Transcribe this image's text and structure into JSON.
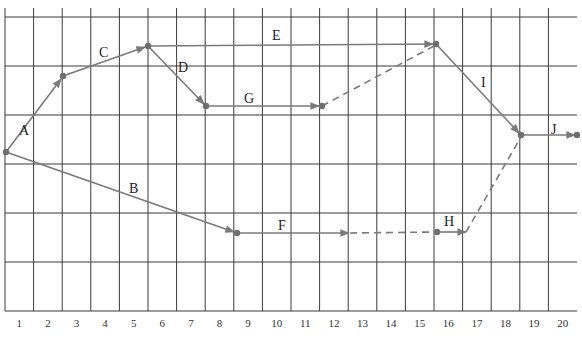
{
  "diagram": {
    "type": "activity-network-on-time-grid",
    "axis": {
      "labels": [
        "1",
        "2",
        "3",
        "4",
        "5",
        "6",
        "7",
        "8",
        "9",
        "10",
        "11",
        "12",
        "13",
        "14",
        "15",
        "16",
        "17",
        "18",
        "19",
        "20"
      ]
    },
    "colors": {
      "grid": "#3a3a3a",
      "edge": "#7a7a7a",
      "node": "#6e6e6e",
      "text": "#222222"
    },
    "activities": [
      {
        "id": "A",
        "label": "A",
        "style": "solid"
      },
      {
        "id": "B",
        "label": "B",
        "style": "solid"
      },
      {
        "id": "C",
        "label": "C",
        "style": "solid"
      },
      {
        "id": "D",
        "label": "D",
        "style": "solid"
      },
      {
        "id": "E",
        "label": "E",
        "style": "solid"
      },
      {
        "id": "F",
        "label": "F",
        "style": "solid+float"
      },
      {
        "id": "G",
        "label": "G",
        "style": "solid"
      },
      {
        "id": "H",
        "label": "H",
        "style": "solid+float"
      },
      {
        "id": "I",
        "label": "I",
        "style": "solid"
      },
      {
        "id": "J",
        "label": "J",
        "style": "solid"
      }
    ]
  }
}
